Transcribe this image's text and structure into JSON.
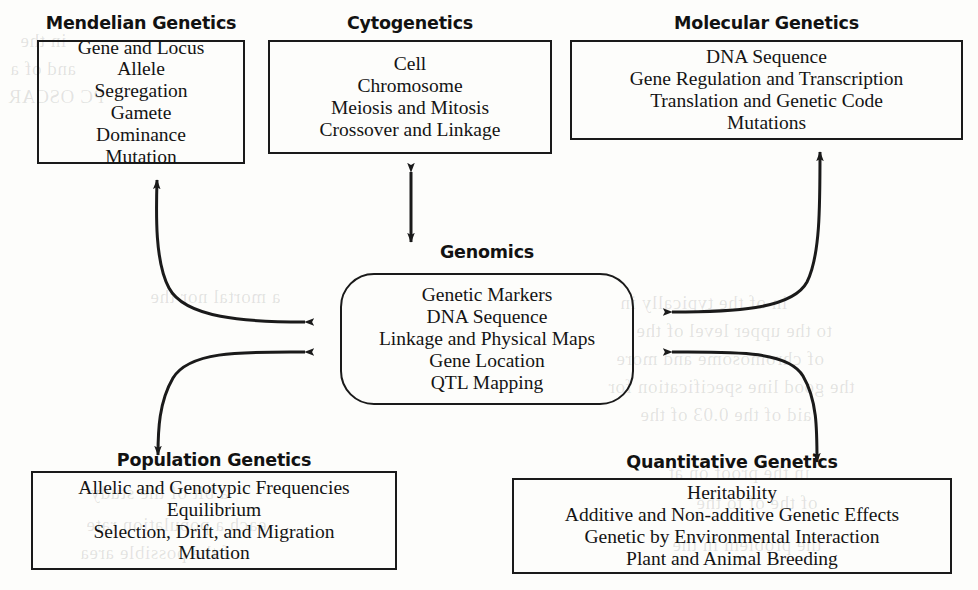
{
  "diagram": {
    "background_color": "#fdfdfb",
    "line_color": "#1a1a1a",
    "nodes": [
      {
        "id": "mendelian",
        "title": "Mendelian Genetics",
        "shape": "rectangle",
        "lines": [
          "Gene and Locus",
          "Allele",
          "Segregation",
          "Gamete",
          "Dominance",
          "Mutation"
        ]
      },
      {
        "id": "cytogenetics",
        "title": "Cytogenetics",
        "shape": "rectangle",
        "lines": [
          "Cell",
          "Chromosome",
          "Meiosis and Mitosis",
          "Crossover and Linkage"
        ]
      },
      {
        "id": "molecular",
        "title": "Molecular Genetics",
        "shape": "rectangle",
        "lines": [
          "DNA Sequence",
          "Gene Regulation and Transcription",
          "Translation and Genetic Code",
          "Mutations"
        ]
      },
      {
        "id": "genomics",
        "title": "Genomics",
        "shape": "rounded-rectangle",
        "lines": [
          "Genetic Markers",
          "DNA Sequence",
          "Linkage and Physical Maps",
          "Gene Location",
          "QTL Mapping"
        ]
      },
      {
        "id": "population",
        "title": "Population Genetics",
        "shape": "rectangle",
        "lines": [
          "Allelic and Genotypic Frequencies",
          "Equilibrium",
          "Selection, Drift, and Migration",
          "Mutation"
        ]
      },
      {
        "id": "quantitative",
        "title": "Quantitative Genetics",
        "shape": "rectangle",
        "lines": [
          "Heritability",
          "Additive and Non-additive Genetic Effects",
          "Genetic by Environmental Interaction",
          "Plant and Animal Breeding"
        ]
      }
    ],
    "connectors": [
      {
        "id": "mendelian-genomics",
        "from": "mendelian",
        "to": "genomics",
        "style": "curved",
        "heads": "both"
      },
      {
        "id": "cytogenetics-genomics",
        "from": "cytogenetics",
        "to": "genomics",
        "style": "straight",
        "heads": "both"
      },
      {
        "id": "molecular-genomics",
        "from": "molecular",
        "to": "genomics",
        "style": "curved",
        "heads": "both"
      },
      {
        "id": "population-genomics",
        "from": "population",
        "to": "genomics",
        "style": "curved",
        "heads": "both"
      },
      {
        "id": "quantitative-genomics",
        "from": "quantitative",
        "to": "genomics",
        "style": "curved",
        "heads": "both"
      }
    ],
    "ghost_text": [
      {
        "text": "in the",
        "x": 40,
        "y": 42
      },
      {
        "text": "and of a",
        "x": 20,
        "y": 70
      },
      {
        "text": "PC OSCAR",
        "x": 18,
        "y": 96
      },
      {
        "text": "a mortal nor the",
        "x": 160,
        "y": 292
      },
      {
        "text": "in of the typically in",
        "x": 620,
        "y": 300
      },
      {
        "text": "to the upper level of the",
        "x": 640,
        "y": 330
      },
      {
        "text": "of chromosome and more",
        "x": 618,
        "y": 356
      },
      {
        "text": "the good line specification for",
        "x": 610,
        "y": 382
      },
      {
        "text": "aid of the 0.03 of the",
        "x": 640,
        "y": 408
      },
      {
        "text": "a bit of the study",
        "x": 100,
        "y": 488
      },
      {
        "text": "each a population rate",
        "x": 96,
        "y": 520
      },
      {
        "text": "of the possible area",
        "x": 88,
        "y": 548
      },
      {
        "text": "in the proof on at",
        "x": 672,
        "y": 468
      },
      {
        "text": "of the of to the",
        "x": 700,
        "y": 498
      },
      {
        "text": "the problem in the",
        "x": 676,
        "y": 540
      }
    ]
  }
}
